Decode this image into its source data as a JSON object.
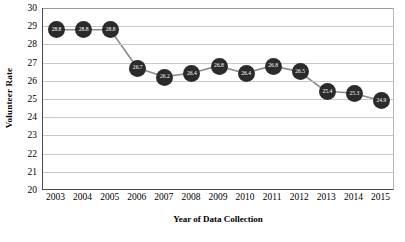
{
  "chart_data": {
    "type": "line",
    "title": "",
    "xlabel": "Year of Data Collection",
    "ylabel": "Volunteer Rate",
    "categories": [
      "2003",
      "2004",
      "2005",
      "2006",
      "2007",
      "2008",
      "2009",
      "2010",
      "2011",
      "2012",
      "2013",
      "2014",
      "2015"
    ],
    "values": [
      28.8,
      28.8,
      28.8,
      26.7,
      26.2,
      26.4,
      26.8,
      26.4,
      26.8,
      26.5,
      25.4,
      25.3,
      24.9
    ],
    "point_labels": [
      "28.8",
      "28.8",
      "28.8",
      "26.7",
      "26.2",
      "26.4",
      "26.8",
      "26.4",
      "26.8",
      "26.5",
      "25.4",
      "25.3",
      "24.9"
    ],
    "ylim": [
      20,
      30
    ],
    "ytick_step": 1,
    "ytick_labels": [
      "30",
      "29",
      "28",
      "27",
      "26",
      "25",
      "24",
      "23",
      "22",
      "21",
      "20"
    ],
    "grid": "horizontal",
    "legend": "none",
    "colors": {
      "marker": "#2b2b2b",
      "line": "#8c8c8c",
      "gridline": "#c9c9c9",
      "axis": "#4a4a4a",
      "label_text": "#ffffff",
      "text": "#000000"
    }
  }
}
